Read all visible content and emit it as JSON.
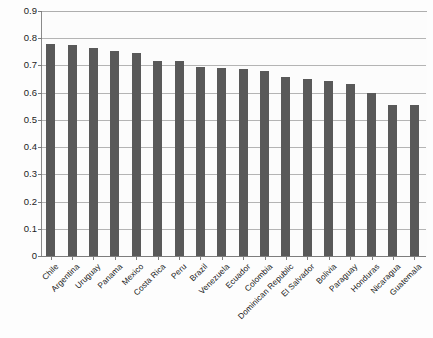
{
  "chart_data": {
    "type": "bar",
    "title": "",
    "subtitle": "",
    "xlabel": "",
    "ylabel": "",
    "ylim": [
      0,
      0.9
    ],
    "ytick_labels": [
      "0",
      "0.1",
      "0.2",
      "0.3",
      "0.4",
      "0.5",
      "0.6",
      "0.7",
      "0.8",
      "0.9"
    ],
    "ytick_values": [
      0,
      0.1,
      0.2,
      0.3,
      0.4,
      0.5,
      0.6,
      0.7,
      0.8,
      0.9
    ],
    "grid": true,
    "legend": "none",
    "bar_color": "#595959",
    "categories": [
      "Chile",
      "Argentina",
      "Uruguay",
      "Panama",
      "Mexico",
      "Costa Rica",
      "Peru",
      "Brazil",
      "Venezuela",
      "Ecuador",
      "Colombia",
      "Dominican Republic",
      "El Salvador",
      "Bolivia",
      "Paraguay",
      "Honduras",
      "Nicaragua",
      "Guatemala"
    ],
    "values": [
      0.78,
      0.775,
      0.763,
      0.752,
      0.745,
      0.718,
      0.715,
      0.693,
      0.69,
      0.688,
      0.68,
      0.657,
      0.651,
      0.642,
      0.633,
      0.597,
      0.555,
      0.555
    ]
  }
}
